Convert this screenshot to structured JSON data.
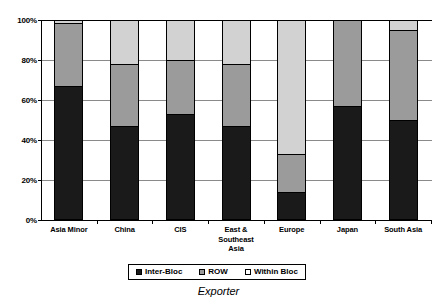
{
  "chart_data": {
    "type": "bar",
    "stacked": true,
    "stack_mode": "percent",
    "title": "",
    "xlabel": "Exporter",
    "ylabel": "",
    "ylim": [
      0,
      100
    ],
    "yticks": [
      0,
      20,
      40,
      60,
      80,
      100
    ],
    "ytick_labels": [
      "0%",
      "20%",
      "40%",
      "60%",
      "80%",
      "100%"
    ],
    "grid": true,
    "legend_position": "bottom",
    "categories": [
      "Asia Minor",
      "China",
      "CIS",
      "East & Southeast Asia",
      "Europe",
      "Japan",
      "South Asia"
    ],
    "series": [
      {
        "name": "Inter-Bloc",
        "color": "#1a1a1a",
        "values": [
          67,
          47,
          53,
          47,
          14,
          57,
          50
        ]
      },
      {
        "name": "ROW",
        "color": "#9b9b9b",
        "values": [
          31.5,
          31,
          27,
          31,
          19,
          43,
          45
        ]
      },
      {
        "name": "Within Bloc",
        "color": "#d2d2d2",
        "values": [
          1.5,
          22,
          20,
          22,
          67,
          0,
          5
        ]
      }
    ]
  },
  "axis": {
    "x_title": "Exporter"
  },
  "category_labels": [
    "Asia Minor",
    "China",
    "CIS",
    "East &\nSoutheast\nAsia",
    "Europe",
    "Japan",
    "South Asia"
  ],
  "legend": {
    "items": [
      {
        "label": "Inter-Bloc",
        "color": "#1a1a1a"
      },
      {
        "label": "ROW",
        "color": "#9b9b9b"
      },
      {
        "label": "Within Bloc",
        "color": "#ffffff"
      }
    ]
  },
  "colors": {
    "inter_bloc": "#1a1a1a",
    "row": "#9b9b9b",
    "within_bloc": "#d2d2d2",
    "grid": "#8a8a8a",
    "axis": "#000000",
    "background": "#ffffff"
  }
}
